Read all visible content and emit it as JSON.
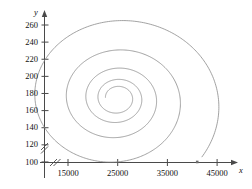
{
  "figure": {
    "background": "#ffffff",
    "curve_color": "#8a8a8a",
    "axis_color": "#4a4a4a",
    "marker_color": "#6e6e6e"
  },
  "axes": {
    "x": {
      "name": "x",
      "ticks": [
        "15000",
        "25000",
        "35000",
        "45000"
      ],
      "tick_values": [
        15000,
        25000,
        35000,
        45000
      ],
      "axis_break": true,
      "arrow": true
    },
    "y": {
      "name": "y",
      "ticks": [
        "260",
        "240",
        "220",
        "200",
        "180",
        "160",
        "140",
        "120",
        "100"
      ],
      "tick_values": [
        260,
        240,
        220,
        200,
        180,
        160,
        140,
        120,
        100
      ],
      "axis_break": true,
      "arrow": true
    }
  },
  "chart_data": {
    "type": "line",
    "title": "",
    "xlabel": "x",
    "ylabel": "y",
    "xlim": [
      5000,
      49000
    ],
    "ylim": [
      88,
      272
    ],
    "grid": false,
    "legend": null,
    "series": [
      {
        "name": "spiral-trajectory",
        "kind": "spiral",
        "focus": [
          25000,
          175
        ],
        "start_point": [
          41000,
          100
        ],
        "start_marker": "square",
        "turns": 4.6,
        "decay": 0.62,
        "x_scale": 10500,
        "y_scale": 46,
        "points": [
          [
            41000,
            100
          ],
          [
            42600,
            110
          ],
          [
            43900,
            124
          ],
          [
            44900,
            142
          ],
          [
            45300,
            162
          ],
          [
            45000,
            183
          ],
          [
            44000,
            204
          ],
          [
            42400,
            222
          ],
          [
            40200,
            238
          ],
          [
            37500,
            250
          ],
          [
            34400,
            258
          ],
          [
            31100,
            262
          ],
          [
            27800,
            261
          ],
          [
            24700,
            256
          ],
          [
            21900,
            247
          ],
          [
            19600,
            235
          ],
          [
            18000,
            220
          ],
          [
            17100,
            204
          ],
          [
            16900,
            188
          ],
          [
            17400,
            172
          ],
          [
            18500,
            157
          ],
          [
            20100,
            144
          ],
          [
            22100,
            134
          ],
          [
            24300,
            127
          ],
          [
            26600,
            123
          ],
          [
            28800,
            123
          ],
          [
            30800,
            126
          ],
          [
            32400,
            133
          ],
          [
            33500,
            142
          ],
          [
            34000,
            153
          ],
          [
            33900,
            164
          ],
          [
            33200,
            175
          ],
          [
            32000,
            185
          ],
          [
            30400,
            192
          ],
          [
            28600,
            196
          ],
          [
            26700,
            197
          ],
          [
            24900,
            195
          ],
          [
            23300,
            190
          ],
          [
            22100,
            183
          ],
          [
            21300,
            175
          ],
          [
            21100,
            166
          ],
          [
            21400,
            158
          ],
          [
            22100,
            152
          ],
          [
            23100,
            147
          ],
          [
            24300,
            145
          ],
          [
            25500,
            145
          ],
          [
            26600,
            147
          ],
          [
            27500,
            152
          ],
          [
            28000,
            158
          ],
          [
            28100,
            165
          ],
          [
            27900,
            171
          ],
          [
            27300,
            177
          ],
          [
            26500,
            180
          ],
          [
            25600,
            182
          ],
          [
            24700,
            181
          ],
          [
            23900,
            179
          ],
          [
            23300,
            175
          ],
          [
            23100,
            171
          ],
          [
            23200,
            167
          ],
          [
            23600,
            164
          ],
          [
            24200,
            162
          ],
          [
            24900,
            162
          ],
          [
            25500,
            164
          ],
          [
            25900,
            167
          ],
          [
            26000,
            171
          ],
          [
            25900,
            175
          ],
          [
            25500,
            177
          ],
          [
            25000,
            178
          ],
          [
            24600,
            177
          ],
          [
            24300,
            175
          ],
          [
            24200,
            173
          ],
          [
            24400,
            171
          ],
          [
            24700,
            170
          ],
          [
            25000,
            171
          ],
          [
            25200,
            173
          ],
          [
            25200,
            175
          ],
          [
            25100,
            176
          ],
          [
            24900,
            176
          ],
          [
            24800,
            175
          ],
          [
            24850,
            174
          ],
          [
            25000,
            175
          ]
        ]
      }
    ]
  }
}
